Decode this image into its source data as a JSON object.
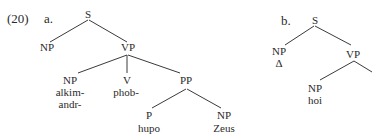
{
  "example_number": "(20)",
  "tree_a": {
    "label": "a.",
    "root": "S",
    "subject": "NP",
    "vp": "VP",
    "vp_np": "NP",
    "vp_np_word_1": "alkim-",
    "vp_np_word_2": "andr-",
    "verb": "V",
    "verb_word": "phob-",
    "pp": "PP",
    "p": "P",
    "p_word": "hupo",
    "pp_np": "NP",
    "pp_np_word": "Zeus"
  },
  "tree_b": {
    "label": "b.",
    "root": "S",
    "subject": "NP",
    "subject_word": "Δ",
    "vp": "VP",
    "vp_np": "NP",
    "vp_np_word": "hoi"
  }
}
